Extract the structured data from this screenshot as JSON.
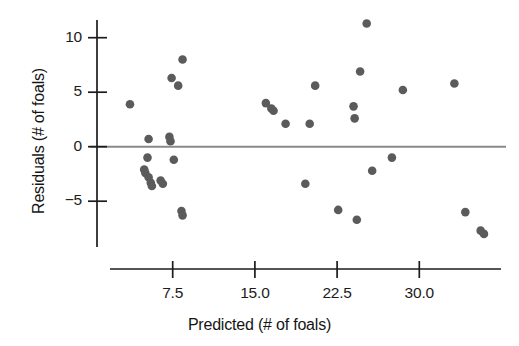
{
  "chart_data": {
    "type": "scatter",
    "title": "",
    "xlabel": "Predicted (# of foals)",
    "ylabel": "Residuals (# of foals)",
    "xlim": [
      1.8,
      37.5
    ],
    "ylim": [
      -9.2,
      12.2
    ],
    "xticks": [
      7.5,
      15.0,
      22.5,
      30.0
    ],
    "xtick_labels": [
      "7.5",
      "15.0",
      "22.5",
      "30.0"
    ],
    "yticks": [
      10,
      5,
      0,
      -5
    ],
    "ytick_labels": [
      "10",
      "5",
      "0",
      "−5"
    ],
    "grid": false,
    "legend": null,
    "reference_line": {
      "orientation": "horizontal",
      "y": 0,
      "color": "#8a8a8a"
    },
    "marker": {
      "shape": "circle",
      "color": "#5b5b5b",
      "size": 8.6
    },
    "point_count": 36,
    "points": [
      {
        "x": 3.6,
        "y": 3.9
      },
      {
        "x": 5.3,
        "y": 0.7
      },
      {
        "x": 5.2,
        "y": -1.0
      },
      {
        "x": 4.9,
        "y": -2.1
      },
      {
        "x": 5.0,
        "y": -2.4
      },
      {
        "x": 5.3,
        "y": -2.8
      },
      {
        "x": 5.5,
        "y": -3.3
      },
      {
        "x": 5.6,
        "y": -3.6
      },
      {
        "x": 6.4,
        "y": -3.1
      },
      {
        "x": 6.6,
        "y": -3.4
      },
      {
        "x": 7.2,
        "y": 0.9
      },
      {
        "x": 7.3,
        "y": 0.5
      },
      {
        "x": 7.4,
        "y": 6.3
      },
      {
        "x": 8.0,
        "y": 5.6
      },
      {
        "x": 8.4,
        "y": 8.0
      },
      {
        "x": 7.6,
        "y": -1.2
      },
      {
        "x": 8.3,
        "y": -5.9
      },
      {
        "x": 8.4,
        "y": -6.3
      },
      {
        "x": 16.0,
        "y": 4.0
      },
      {
        "x": 16.5,
        "y": 3.5
      },
      {
        "x": 16.7,
        "y": 3.3
      },
      {
        "x": 17.8,
        "y": 2.1
      },
      {
        "x": 20.0,
        "y": 2.1
      },
      {
        "x": 19.6,
        "y": -3.4
      },
      {
        "x": 20.5,
        "y": 5.6
      },
      {
        "x": 22.6,
        "y": -5.8
      },
      {
        "x": 24.0,
        "y": 3.7
      },
      {
        "x": 24.1,
        "y": 2.6
      },
      {
        "x": 24.6,
        "y": 6.9
      },
      {
        "x": 24.3,
        "y": -6.7
      },
      {
        "x": 25.2,
        "y": 11.3
      },
      {
        "x": 25.7,
        "y": -2.2
      },
      {
        "x": 27.5,
        "y": -1.0
      },
      {
        "x": 28.5,
        "y": 5.2
      },
      {
        "x": 33.2,
        "y": 5.8
      },
      {
        "x": 34.2,
        "y": -6.0
      },
      {
        "x": 35.6,
        "y": -7.7
      },
      {
        "x": 35.9,
        "y": -8.0
      }
    ]
  },
  "figure": {
    "background_color": "#ffffff",
    "axis_color": "#1c1c1c",
    "zero_line_color": "#8a8a8a"
  }
}
